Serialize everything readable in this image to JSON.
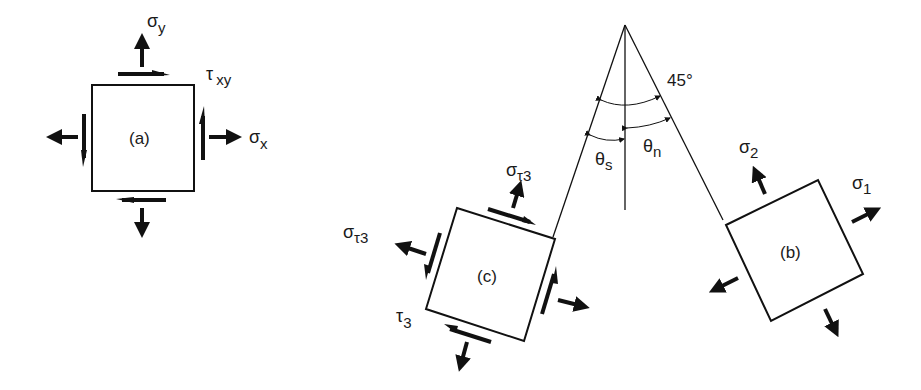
{
  "diagram": {
    "element_a": {
      "label": "(a)",
      "sigma_y": "σ",
      "sigma_y_sub": "y",
      "sigma_x": "σ",
      "sigma_x_sub": "x",
      "tau_xy": "τ",
      "tau_xy_sub": "xy"
    },
    "element_b": {
      "label": "(b)",
      "sigma_1": "σ",
      "sigma_1_sub": "1",
      "sigma_2": "σ",
      "sigma_2_sub": "2"
    },
    "element_c": {
      "label": "(c)",
      "sigma_tau3_top": "σ",
      "sigma_tau3_top_sub": "τ3",
      "sigma_tau3_left": "σ",
      "sigma_tau3_left_sub": "τ3",
      "tau_3": "τ",
      "tau_3_sub": "3"
    },
    "angles": {
      "angle_45": "45°",
      "theta_s": "θ",
      "theta_s_sub": "s",
      "theta_n": "θ",
      "theta_n_sub": "n"
    }
  }
}
